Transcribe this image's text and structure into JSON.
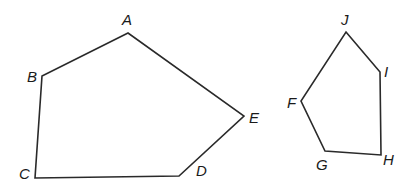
{
  "diagram": {
    "type": "geometry-polygons",
    "polygons": [
      {
        "name": "pentagon-ABCDE",
        "vertices": [
          {
            "label": "A",
            "x": 128,
            "y": 33,
            "lx": 122,
            "ly": 25
          },
          {
            "label": "B",
            "x": 42,
            "y": 76,
            "lx": 27,
            "ly": 82
          },
          {
            "label": "C",
            "x": 35,
            "y": 178,
            "lx": 19,
            "ly": 179
          },
          {
            "label": "D",
            "x": 179,
            "y": 176,
            "lx": 196,
            "ly": 176
          },
          {
            "label": "E",
            "x": 244,
            "y": 116,
            "lx": 249,
            "ly": 123
          }
        ]
      },
      {
        "name": "pentagon-FGHIJ",
        "vertices": [
          {
            "label": "J",
            "x": 346,
            "y": 32,
            "lx": 341,
            "ly": 25
          },
          {
            "label": "I",
            "x": 380,
            "y": 72,
            "lx": 384,
            "ly": 77
          },
          {
            "label": "H",
            "x": 381,
            "y": 155,
            "lx": 383,
            "ly": 165
          },
          {
            "label": "G",
            "x": 325,
            "y": 151,
            "lx": 316,
            "ly": 170
          },
          {
            "label": "F",
            "x": 301,
            "y": 101,
            "lx": 287,
            "ly": 108
          }
        ]
      }
    ]
  }
}
